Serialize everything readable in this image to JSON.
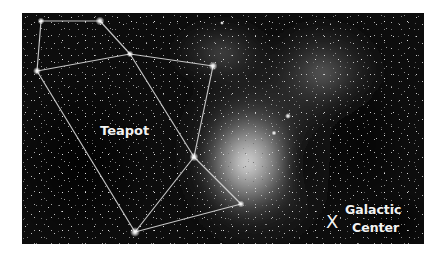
{
  "figure": {
    "background_color": "#0b0b0b",
    "line_color": "#d8d8d8",
    "star_color": "#ffffff"
  },
  "labels": {
    "asterism": "Teapot",
    "marker": "X",
    "galactic_center_line1": "Galactic",
    "galactic_center_line2": "Center"
  },
  "stars": [
    {
      "name": "handle-top-left",
      "x": 19,
      "y": 8
    },
    {
      "name": "handle-top-right",
      "x": 78,
      "y": 8
    },
    {
      "name": "handle-bottom-left",
      "x": 15,
      "y": 58
    },
    {
      "name": "lid-top",
      "x": 108,
      "y": 41
    },
    {
      "name": "spout-top",
      "x": 191,
      "y": 53
    },
    {
      "name": "body-right",
      "x": 172,
      "y": 144
    },
    {
      "name": "spout-tip",
      "x": 219,
      "y": 191
    },
    {
      "name": "body-bottom",
      "x": 113,
      "y": 219
    }
  ],
  "lines": [
    [
      0,
      1
    ],
    [
      0,
      2
    ],
    [
      1,
      3
    ],
    [
      2,
      3
    ],
    [
      3,
      4
    ],
    [
      4,
      5
    ],
    [
      3,
      5
    ],
    [
      2,
      7
    ],
    [
      7,
      5
    ],
    [
      5,
      6
    ],
    [
      7,
      6
    ]
  ]
}
